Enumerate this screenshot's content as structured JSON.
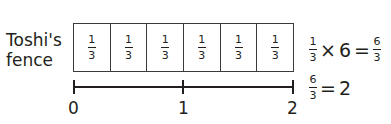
{
  "label": {
    "line1": "Toshi's",
    "line2": "fence"
  },
  "fence": {
    "cells": [
      {
        "num": "1",
        "den": "3"
      },
      {
        "num": "1",
        "den": "3"
      },
      {
        "num": "1",
        "den": "3"
      },
      {
        "num": "1",
        "den": "3"
      },
      {
        "num": "1",
        "den": "3"
      },
      {
        "num": "1",
        "den": "3"
      }
    ]
  },
  "number_line": {
    "ticks": [
      "0",
      "1",
      "2"
    ]
  },
  "equations": {
    "eq1": {
      "lhs_num": "1",
      "lhs_den": "3",
      "times": "×",
      "factor": "6",
      "equals": "=",
      "rhs_num": "6",
      "rhs_den": "3"
    },
    "eq2": {
      "lhs_num": "6",
      "lhs_den": "3",
      "equals": "=",
      "result": "2"
    }
  }
}
